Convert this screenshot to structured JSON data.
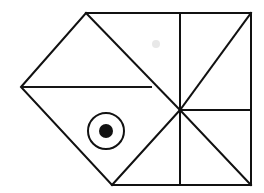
{
  "figure": {
    "canvas": {
      "width": 264,
      "height": 193,
      "background": "#ffffff"
    },
    "stroke_color": "#111111",
    "stroke_width": 2,
    "points": {
      "left_vertex": {
        "x": 21,
        "y": 87
      },
      "top_apex": {
        "x": 86,
        "y": 13
      },
      "top_right": {
        "x": 251,
        "y": 13
      },
      "hub": {
        "x": 180,
        "y": 110
      },
      "bottom_right": {
        "x": 251,
        "y": 185
      },
      "bottom_vertex": {
        "x": 112,
        "y": 185
      },
      "fin_right": {
        "x": 152,
        "y": 87
      },
      "mid_right": {
        "x": 251,
        "y": 110
      },
      "top_divider": {
        "x": 180,
        "y": 13
      },
      "bottom_divider": {
        "x": 180,
        "y": 185
      }
    },
    "segments": [
      {
        "name": "upper-left-edge",
        "from": "left_vertex",
        "to": "top_apex"
      },
      {
        "name": "top-edge",
        "from": "top_apex",
        "to": "top_right"
      },
      {
        "name": "right-edge-upper",
        "from": "top_right",
        "to": "mid_right"
      },
      {
        "name": "right-edge-lower",
        "from": "mid_right",
        "to": "bottom_right"
      },
      {
        "name": "bottom-edge",
        "from": "bottom_right",
        "to": "bottom_vertex"
      },
      {
        "name": "lower-left-edge",
        "from": "bottom_vertex",
        "to": "left_vertex"
      },
      {
        "name": "fin-horizontal",
        "from": "left_vertex",
        "to": "fin_right"
      },
      {
        "name": "fin-diagonal",
        "from": "top_apex",
        "to": "hub"
      },
      {
        "name": "body-diagonal",
        "from": "bottom_vertex",
        "to": "hub"
      },
      {
        "name": "tail-vertical",
        "from": "top_divider",
        "to": "bottom_divider"
      },
      {
        "name": "tail-horizontal",
        "from": "hub",
        "to": "mid_right"
      },
      {
        "name": "tail-diagonal-upper",
        "from": "hub",
        "to": "top_right"
      },
      {
        "name": "tail-diagonal-lower",
        "from": "hub",
        "to": "bottom_right"
      }
    ],
    "eye": {
      "name": "fish-eye",
      "center": {
        "x": 106,
        "y": 131
      },
      "outer_radius": 18,
      "pupil_radius": 7,
      "ring_color": "#111111",
      "pupil_color": "#111111"
    },
    "smudge": {
      "name": "paper-smudge",
      "center": {
        "x": 156,
        "y": 44
      },
      "radius": 4,
      "color": "#e8e8e8"
    }
  }
}
